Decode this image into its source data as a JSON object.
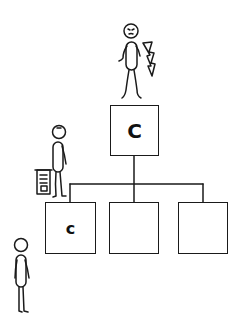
{
  "diagram": {
    "type": "org-chart",
    "top_box": {
      "label": "C"
    },
    "child_boxes": [
      {
        "label": "c"
      },
      {
        "label": ""
      },
      {
        "label": ""
      }
    ],
    "figures": [
      {
        "name": "angry-boss-with-lightning",
        "position": "on top of top box"
      },
      {
        "name": "person-holding-document",
        "position": "standing on hierarchy line, left"
      },
      {
        "name": "person-standing",
        "position": "bottom left, outside hierarchy"
      }
    ]
  }
}
